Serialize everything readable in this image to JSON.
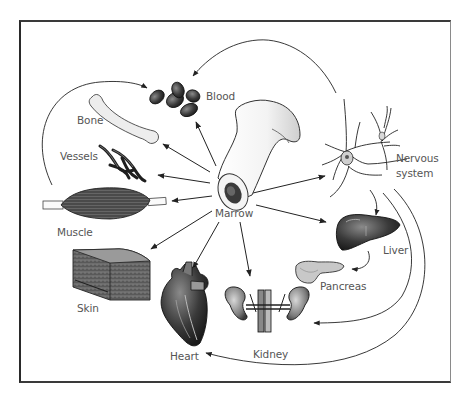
{
  "diagram": {
    "type": "radial-flow",
    "center": {
      "id": "marrow",
      "label": "Marrow"
    },
    "nodes": [
      {
        "id": "blood",
        "label": "Blood"
      },
      {
        "id": "bone",
        "label": "Bone"
      },
      {
        "id": "vessels",
        "label": "Vessels"
      },
      {
        "id": "muscle",
        "label": "Muscle"
      },
      {
        "id": "skin",
        "label": "Skin"
      },
      {
        "id": "heart",
        "label": "Heart"
      },
      {
        "id": "kidney",
        "label": "Kidney"
      },
      {
        "id": "liver",
        "label": "Liver"
      },
      {
        "id": "pancreas",
        "label": "Pancreas"
      },
      {
        "id": "nervous",
        "label": "Nervous",
        "label2": "system"
      }
    ],
    "edges": [
      {
        "from": "marrow",
        "to": "blood"
      },
      {
        "from": "marrow",
        "to": "bone"
      },
      {
        "from": "marrow",
        "to": "vessels"
      },
      {
        "from": "marrow",
        "to": "muscle"
      },
      {
        "from": "marrow",
        "to": "skin"
      },
      {
        "from": "marrow",
        "to": "heart"
      },
      {
        "from": "marrow",
        "to": "kidney"
      },
      {
        "from": "marrow",
        "to": "liver"
      },
      {
        "from": "marrow",
        "to": "nervous"
      },
      {
        "from": "muscle",
        "to": "blood"
      },
      {
        "from": "nervous",
        "to": "blood"
      },
      {
        "from": "nervous",
        "to": "liver"
      },
      {
        "from": "nervous",
        "to": "kidney"
      },
      {
        "from": "nervous",
        "to": "heart"
      },
      {
        "from": "liver",
        "to": "pancreas"
      }
    ]
  },
  "colors": {
    "frame": "#2a2a2a",
    "ink": "#222222",
    "label": "#555555",
    "background": "#ffffff"
  }
}
